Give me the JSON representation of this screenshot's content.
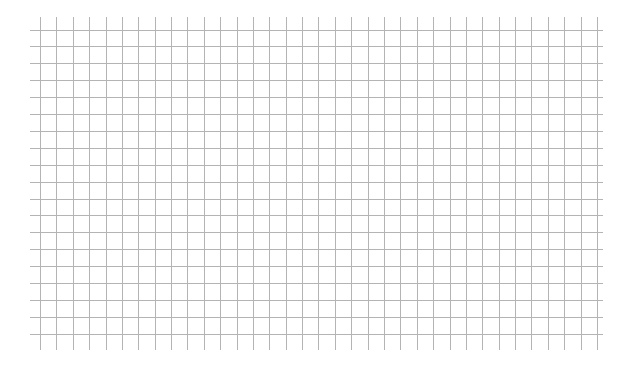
{
  "canvas": {
    "width": 631,
    "height": 369,
    "background": "#ffffff"
  },
  "grid": {
    "line_color": "#b4b4b4",
    "line_width": 1,
    "vertical": {
      "count": 35,
      "x_start": 40,
      "spacing": 16.38,
      "y_from": 17,
      "y_to": 350
    },
    "horizontal": {
      "count": 19,
      "y_start": 29.5,
      "spacing": 16.9,
      "x_from": 30,
      "x_to": 603
    }
  }
}
